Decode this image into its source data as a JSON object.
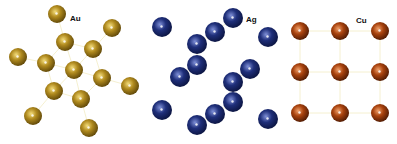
{
  "labels": {
    "au": "Au",
    "ag": "Ag",
    "cu": "Cu"
  },
  "colors": {
    "au": "#b08a1e",
    "au_dark": "#5e4608",
    "au_light": "#f3dc7a",
    "ag": "#1f2f7a",
    "ag_dark": "#0b1440",
    "ag_light": "#7f90d8",
    "cu": "#a8420d",
    "cu_dark": "#4e1a03",
    "cu_light": "#f0a06a",
    "bond": "#f3ecc4"
  },
  "structures": [
    {
      "element": "Au",
      "radius": 9,
      "atoms": [
        [
          57,
          14
        ],
        [
          112,
          28
        ],
        [
          65,
          42
        ],
        [
          93,
          49
        ],
        [
          18,
          57
        ],
        [
          46,
          63
        ],
        [
          74,
          70
        ],
        [
          102,
          78
        ],
        [
          130,
          86
        ],
        [
          54,
          91
        ],
        [
          81,
          99
        ],
        [
          33,
          116
        ],
        [
          89,
          128
        ]
      ]
    },
    {
      "element": "Ag",
      "radius": 10,
      "atoms": [
        [
          162,
          27
        ],
        [
          233,
          18
        ],
        [
          215,
          32
        ],
        [
          197,
          44
        ],
        [
          268,
          37
        ],
        [
          197,
          65
        ],
        [
          180,
          77
        ],
        [
          250,
          69
        ],
        [
          233,
          82
        ],
        [
          233,
          102
        ],
        [
          162,
          110
        ],
        [
          215,
          114
        ],
        [
          197,
          125
        ],
        [
          268,
          119
        ]
      ]
    },
    {
      "element": "Cu",
      "radius": 9,
      "atoms": [
        [
          300,
          31
        ],
        [
          340,
          31
        ],
        [
          380,
          31
        ],
        [
          300,
          72
        ],
        [
          340,
          72
        ],
        [
          380,
          72
        ],
        [
          300,
          113
        ],
        [
          340,
          113
        ],
        [
          380,
          113
        ]
      ]
    }
  ]
}
